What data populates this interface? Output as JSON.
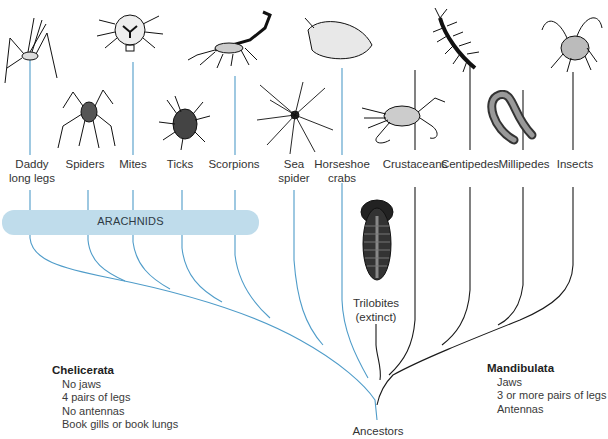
{
  "diagram": {
    "type": "phylogenetic-tree",
    "root_label": "Ancestors",
    "colors": {
      "chelicerata_branch": "#4f9cc9",
      "mandibulata_branch": "#1a1a1a",
      "arachnids_bar": "#bfdceb",
      "label_text": "#333333"
    },
    "taxa": [
      {
        "id": "daddy-long-legs",
        "label_line1": "Daddy",
        "label_line2": "long legs",
        "group": "chelicerata",
        "in_arachnids": true
      },
      {
        "id": "spiders",
        "label_line1": "Spiders",
        "label_line2": "",
        "group": "chelicerata",
        "in_arachnids": true
      },
      {
        "id": "mites",
        "label_line1": "Mites",
        "label_line2": "",
        "group": "chelicerata",
        "in_arachnids": true
      },
      {
        "id": "ticks",
        "label_line1": "Ticks",
        "label_line2": "",
        "group": "chelicerata",
        "in_arachnids": true
      },
      {
        "id": "scorpions",
        "label_line1": "Scorpions",
        "label_line2": "",
        "group": "chelicerata",
        "in_arachnids": true
      },
      {
        "id": "sea-spider",
        "label_line1": "Sea",
        "label_line2": "spider",
        "group": "chelicerata",
        "in_arachnids": false
      },
      {
        "id": "horseshoe-crabs",
        "label_line1": "Horseshoe",
        "label_line2": "crabs",
        "group": "chelicerata",
        "in_arachnids": false
      },
      {
        "id": "crustaceans",
        "label_line1": "Crustaceans",
        "label_line2": "",
        "group": "mandibulata",
        "in_arachnids": false
      },
      {
        "id": "centipedes",
        "label_line1": "Centipedes",
        "label_line2": "",
        "group": "mandibulata",
        "in_arachnids": false
      },
      {
        "id": "millipedes",
        "label_line1": "Millipedes",
        "label_line2": "",
        "group": "mandibulata",
        "in_arachnids": false
      },
      {
        "id": "insects",
        "label_line1": "Insects",
        "label_line2": "",
        "group": "mandibulata",
        "in_arachnids": false
      }
    ],
    "trilobites": {
      "label_line1": "Trilobites",
      "label_line2": "(extinct)"
    },
    "arachnids_label": "ARACHNIDS",
    "groups": {
      "chelicerata": {
        "title": "Chelicerata",
        "traits": [
          "No jaws",
          "4 pairs of legs",
          "No antennas",
          "Book gills or book lungs"
        ]
      },
      "mandibulata": {
        "title": "Mandibulata",
        "traits": [
          "Jaws",
          "3 or more pairs of legs",
          "Antennas"
        ]
      }
    }
  }
}
